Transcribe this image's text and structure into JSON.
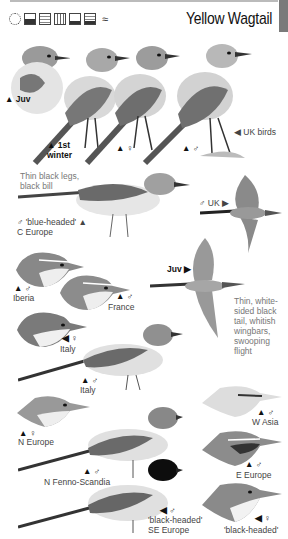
{
  "page": {
    "title": "Yellow Wagtail",
    "habitat_icons": [
      "sun-open-country-icon",
      "coast-icon",
      "farmland-icon",
      "reedbed-icon",
      "grassland-icon",
      "wetland-icon",
      "water-icon"
    ]
  },
  "labels": {
    "juv": "▲ Juv",
    "first_winter": "▲ 1st winter",
    "female_top": "▲ ♀",
    "male_top": "▲ ♂",
    "uk_birds": "◀ UK birds",
    "legs_note": "Thin black legs, black bill",
    "blue_headed": "♂ 'blue-headed' ▲",
    "c_europe": "C Europe",
    "male_uk": "♂ UK ▶",
    "juv_flight": "Juv ▶",
    "flight_note": "Thin, white-sided black tail, whitish wingbars, swooping flight",
    "iberia_sym": "▲ ♂",
    "iberia": "Iberia",
    "france_sym": "▲ ♂",
    "france": "France",
    "italy_f_sym": "◀ ♀",
    "italy_f": "Italy",
    "italy_m_sym": "▲ ♂",
    "italy_m": "Italy",
    "n_europe_sym": "▲ ♀",
    "n_europe": "N Europe",
    "fenno_sym": "▲ ♂",
    "fenno": "N Fenno-Scandia",
    "w_asia_sym": "▲ ♂",
    "w_asia": "W Asia",
    "e_europe_sym": "▲ ♂",
    "e_europe": "E Europe",
    "black_headed_m_sym": "◀ ♂",
    "black_headed_m": "'black-headed'",
    "se_europe": "SE Europe",
    "black_headed_f_sym": "◀ ♀",
    "black_headed_f": "'black-headed'"
  }
}
